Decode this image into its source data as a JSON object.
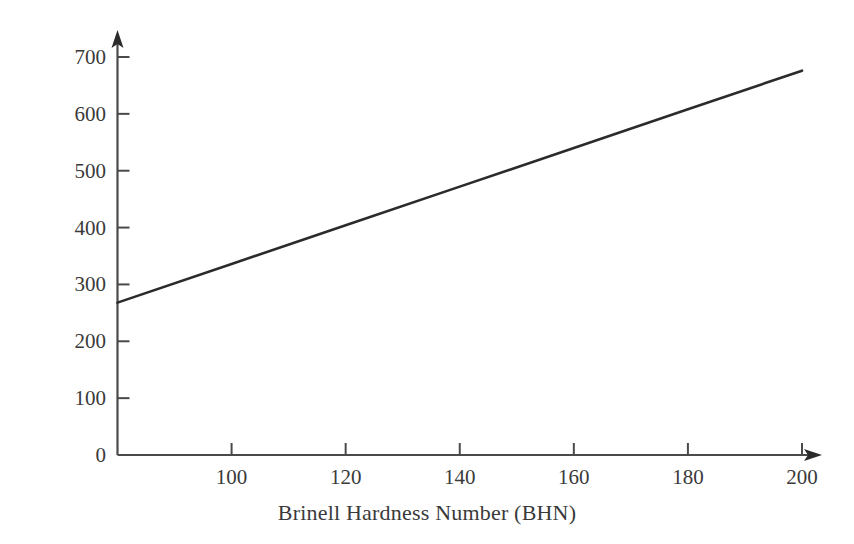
{
  "chart_data": {
    "type": "line",
    "title": "",
    "xlabel": "Brinell Hardness Number (BHN)",
    "ylabel": "Tensile Strength (MPa)",
    "xlim": [
      80,
      210
    ],
    "ylim": [
      0,
      740
    ],
    "xticks": [
      100,
      120,
      140,
      160,
      180,
      200
    ],
    "xtick_labels": [
      "100",
      "120",
      "140",
      "160",
      "180",
      "200"
    ],
    "yticks": [
      0,
      100,
      200,
      300,
      400,
      500,
      600,
      700
    ],
    "ytick_labels": [
      "0",
      "100",
      "200",
      "300",
      "400",
      "500",
      "600",
      "700"
    ],
    "grid": false,
    "legend": false,
    "legend_position": "none",
    "axis_arrows": true,
    "tick_direction": "in",
    "series": [
      {
        "name": "Tensile Strength vs BHN",
        "color": "#2b2b2b",
        "line_width": 2.6,
        "x": [
          80,
          100,
          120,
          140,
          160,
          180,
          200
        ],
        "y": [
          268,
          336,
          404,
          472,
          540,
          608,
          676
        ]
      }
    ],
    "annotations": []
  },
  "axis_colors": {
    "axis_line": "#4a4a4a",
    "tick_mark": "#4a4a4a",
    "text": "#3a3a3a",
    "background": "#ffffff",
    "data_line": "#2b2b2b"
  }
}
